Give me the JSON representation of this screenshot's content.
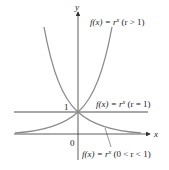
{
  "axes": {
    "x_label": "x",
    "y_label": "y",
    "origin_label": "0",
    "y_tick_label": "1"
  },
  "curves": [
    {
      "id": "growth",
      "label": "f(x) = r^x (r > 1)",
      "label_text": "f(x) = r",
      "sup": "x",
      "cond": " (r > 1)",
      "color": "#8a8a8a"
    },
    {
      "id": "constant",
      "label": "f(x) = r^x (r = 1)",
      "label_text": "f(x) = r",
      "sup": "x",
      "cond": " (r = 1)",
      "color": "#8a8a8a"
    },
    {
      "id": "decay",
      "label": "f(x) = r^x (0 < r < 1)",
      "label_text": "f(x) = r",
      "sup": "x",
      "cond": " (0 < r < 1)",
      "color": "#8a8a8a"
    }
  ],
  "colors": {
    "axis": "#333333",
    "curve": "#8a8a8a",
    "text": "#222222"
  }
}
